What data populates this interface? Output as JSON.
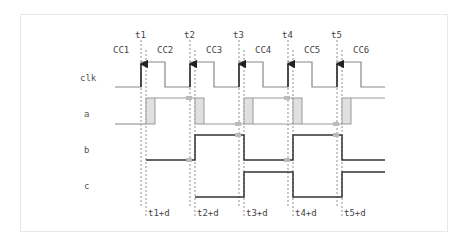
{
  "diagram": {
    "type": "timing-diagram",
    "signals": [
      {
        "name": "clk",
        "label": "clk"
      },
      {
        "name": "a",
        "label": "a"
      },
      {
        "name": "b",
        "label": "b"
      },
      {
        "name": "c",
        "label": "c"
      }
    ],
    "clock_cycles": [
      "CC1",
      "CC2",
      "CC3",
      "CC4",
      "CC5",
      "CC6"
    ],
    "edge_markers": [
      "t1",
      "t2",
      "t3",
      "t4",
      "t5"
    ],
    "delay_markers": [
      "t1+d",
      "t2+d",
      "t3+d",
      "t4+d",
      "t5+d"
    ],
    "colors": {
      "clk_line": "#888888",
      "clk_edge": "#222222",
      "a_line": "#999999",
      "a_pulse_fill": "#e0e0e0",
      "b_line": "#333333",
      "c_line": "#333333",
      "guide": "#666666",
      "panel_border": "#e8e8e8"
    }
  }
}
